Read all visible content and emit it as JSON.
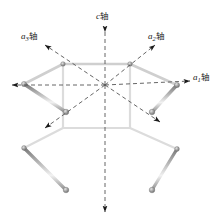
{
  "figure": {
    "background_color": "#ffffff",
    "width": 222,
    "height": 221
  },
  "axes": {
    "c": {
      "name": "c-axis",
      "symbol": "c",
      "subscript": "",
      "unit_label": "轴",
      "direction": "vertical",
      "style": "dashed",
      "arrow_ends": "both",
      "color": "#555555"
    },
    "a1": {
      "name": "a1-axis",
      "symbol": "a",
      "subscript": "1",
      "unit_label": "轴",
      "direction": "horizontal",
      "style": "dashed",
      "arrow_ends": "both",
      "color": "#555555"
    },
    "a2": {
      "name": "a2-axis",
      "symbol": "a",
      "subscript": "2",
      "unit_label": "轴",
      "direction": "upper-right diagonal",
      "style": "dashed",
      "arrow_ends": "both",
      "color": "#555555"
    },
    "a3": {
      "name": "a3-axis",
      "symbol": "a",
      "subscript": "3",
      "unit_label": "轴",
      "direction": "upper-left diagonal",
      "style": "dashed",
      "arrow_ends": "both",
      "color": "#555555"
    }
  },
  "prism": {
    "shape": "hexagonal-prism",
    "edge_color": "#8a8a8a",
    "edge_highlight": "#d9d9d9",
    "node_color": "#777777",
    "face_fill": "#ffffff",
    "top_vertices": [
      [
        24,
        84
      ],
      [
        63,
        64
      ],
      [
        130,
        64
      ],
      [
        177,
        85
      ],
      [
        152,
        112
      ],
      [
        66,
        112
      ]
    ],
    "bottom_vertices": [
      [
        24,
        148
      ],
      [
        63,
        128
      ],
      [
        130,
        128
      ],
      [
        177,
        149
      ],
      [
        152,
        190
      ],
      [
        66,
        190
      ]
    ],
    "origin": [
      105,
      85
    ]
  }
}
